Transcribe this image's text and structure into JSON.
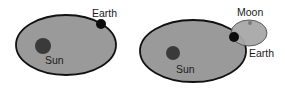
{
  "diagrams": [
    {
      "name": "sun-earth-orbit",
      "labels": {
        "earth": "Earth",
        "sun": "Sun"
      }
    },
    {
      "name": "sun-earth-moon-orbit",
      "labels": {
        "moon": "Moon",
        "earth": "Earth",
        "sun": "Sun"
      }
    }
  ],
  "colors": {
    "orbit_fill": "#9a9a9a",
    "orbit_stroke": "#111111",
    "sun": "#3a3a3a",
    "earth": "#0d0d0d",
    "moon": "#7a7a7a",
    "moon_orbit_fill": "#a8a8a8",
    "moon_orbit_stroke": "#555555"
  }
}
